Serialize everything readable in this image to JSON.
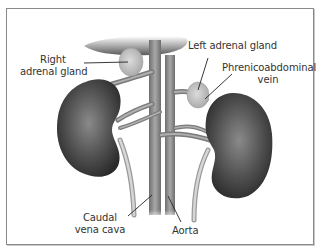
{
  "figure": {
    "labels": {
      "right_adrenal": [
        "Right",
        "adrenal gland"
      ],
      "left_adrenal": "Left adrenal gland",
      "phrenicoabdominal": [
        "Phrenicoabdominal",
        "vein"
      ],
      "caudal_vena_cava": [
        "Caudal",
        "vena cava"
      ],
      "aorta": "Aorta"
    },
    "colors": {
      "frame": "#8a8a8a",
      "kidney": "#4a4a4a",
      "vessel": "#8c8c8c",
      "gland": "#c9c9c9",
      "leader_line": "#222222",
      "text": "#333333"
    }
  }
}
